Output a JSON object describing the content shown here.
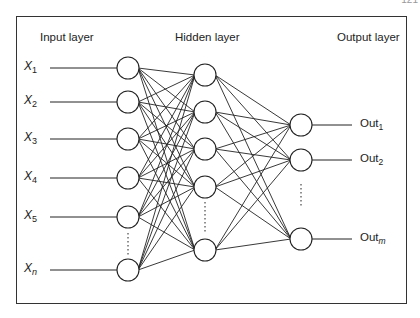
{
  "page_number_fragment": "121",
  "headers": {
    "input": "Input layer",
    "hidden": "Hidden layer",
    "output": "Output layer"
  },
  "inputs": [
    {
      "base": "X",
      "sub": "1",
      "y": 68
    },
    {
      "base": "X",
      "sub": "2",
      "y": 102
    },
    {
      "base": "X",
      "sub": "3",
      "y": 139
    },
    {
      "base": "X",
      "sub": "4",
      "y": 178
    },
    {
      "base": "X",
      "sub": "5",
      "y": 217
    },
    {
      "base": "X",
      "sub": "n",
      "y": 270
    }
  ],
  "hidden": [
    {
      "y": 75
    },
    {
      "y": 112
    },
    {
      "y": 149
    },
    {
      "y": 187
    },
    {
      "y": 250
    }
  ],
  "outputs": [
    {
      "base": "Out",
      "sub": "1",
      "y": 125
    },
    {
      "base": "Out",
      "sub": "2",
      "y": 160
    },
    {
      "base": "Out",
      "sub": "m",
      "y": 239
    }
  ],
  "layout": {
    "input_x": 128,
    "hidden_x": 205,
    "output_x": 301,
    "radius": 11,
    "stroke": "#222"
  }
}
